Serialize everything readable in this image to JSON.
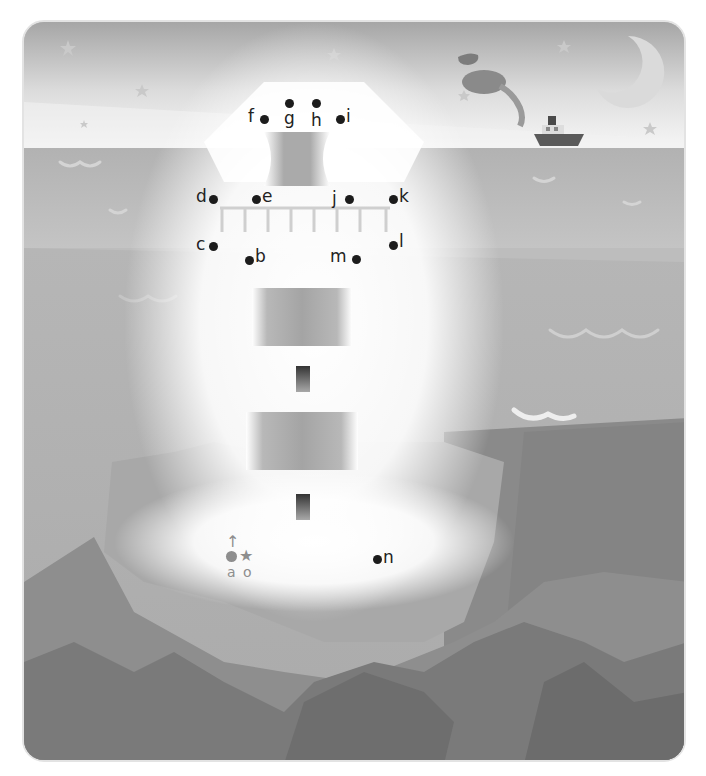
{
  "activity": {
    "type": "connect-the-dots",
    "theme": "lighthouse on cliffs at night",
    "start_marker": {
      "letter": "a",
      "icon": "up-arrow-start"
    },
    "end_marker": {
      "letter": "o",
      "icon": "star-end"
    },
    "dots": [
      {
        "letter": "a",
        "x": 229,
        "y": 553
      },
      {
        "letter": "b",
        "x": 247,
        "y": 258
      },
      {
        "letter": "c",
        "x": 211,
        "y": 244
      },
      {
        "letter": "d",
        "x": 211,
        "y": 197
      },
      {
        "letter": "e",
        "x": 254,
        "y": 197
      },
      {
        "letter": "f",
        "x": 262,
        "y": 117
      },
      {
        "letter": "g",
        "x": 287,
        "y": 101
      },
      {
        "letter": "h",
        "x": 314,
        "y": 101
      },
      {
        "letter": "i",
        "x": 338,
        "y": 117
      },
      {
        "letter": "j",
        "x": 347,
        "y": 197
      },
      {
        "letter": "k",
        "x": 391,
        "y": 197
      },
      {
        "letter": "l",
        "x": 391,
        "y": 243
      },
      {
        "letter": "m",
        "x": 354,
        "y": 257
      },
      {
        "letter": "n",
        "x": 375,
        "y": 557
      },
      {
        "letter": "o",
        "x": 245,
        "y": 553
      }
    ]
  },
  "scene": {
    "elements": [
      "stars",
      "crescent-moon",
      "steamboat",
      "smoke-puffs",
      "sea-waves",
      "lighthouse-bands",
      "lighthouse-windows",
      "cliffs"
    ]
  },
  "colors": {
    "sky_top": "#9e9e9e",
    "sea": "#b4b4b4",
    "cliff_dark": "#6e6e6e",
    "dot": "#1c1c1c",
    "start_marker": "#8e8e8e"
  }
}
